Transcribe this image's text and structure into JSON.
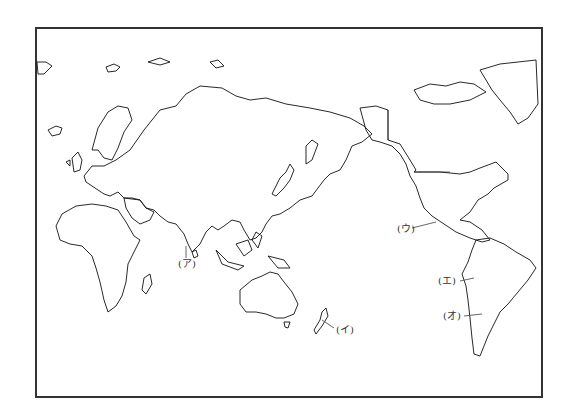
{
  "map": {
    "type": "world-outline-map",
    "projection": "Pacific-centered",
    "frame": {
      "left": 35,
      "top": 27,
      "right": 540,
      "bottom": 395,
      "stroke": "#333333"
    },
    "land_stroke": "#111111",
    "label_color": "#333333"
  },
  "labels": [
    {
      "id": "a",
      "text": "(ア)",
      "x": 178,
      "y": 259,
      "target": "southern tip of India / Sri Lanka"
    },
    {
      "id": "i",
      "text": "(イ)",
      "x": 333,
      "y": 327,
      "target": "New Zealand"
    },
    {
      "id": "u",
      "text": "(ウ)",
      "x": 398,
      "y": 224,
      "target": "Mexico"
    },
    {
      "id": "e",
      "text": "(エ)",
      "x": 439,
      "y": 277,
      "target": "Peru / Andes"
    },
    {
      "id": "o",
      "text": "(オ)",
      "x": 444,
      "y": 312,
      "target": "Chile"
    }
  ]
}
